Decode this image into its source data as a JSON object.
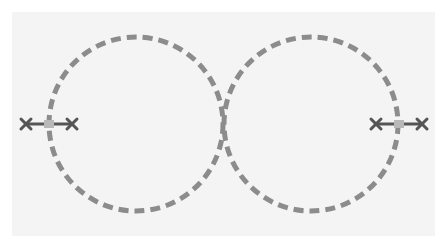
{
  "diagram": {
    "colors": {
      "background": "#ffffff",
      "panel": "#f4f4f4",
      "circle_stroke": "#8c8c8c",
      "marker": "#555555",
      "marker_center": "#b8b8b8"
    },
    "circles": [
      {
        "name": "left-circle",
        "cx": 136,
        "cy": 124,
        "r": 87
      },
      {
        "name": "right-circle",
        "cx": 311,
        "cy": 124,
        "r": 87
      }
    ],
    "markers": [
      {
        "name": "left-marker",
        "x1": 22,
        "x2": 76,
        "y": 124
      },
      {
        "name": "right-marker",
        "x1": 372,
        "x2": 426,
        "y": 124
      }
    ]
  }
}
